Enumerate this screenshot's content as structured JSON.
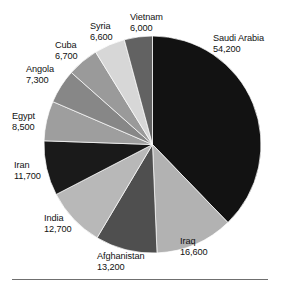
{
  "chart_data": {
    "type": "pie",
    "title": "",
    "subtitle": "",
    "xlabel": "",
    "ylabel": "",
    "legend_position": "labels-around-slices",
    "grid": false,
    "total": 147500,
    "categories": [
      "Saudi Arabia",
      "Iraq",
      "Afghanistan",
      "India",
      "Iran",
      "Egypt",
      "Angola",
      "Cuba",
      "Syria",
      "Vietnam"
    ],
    "values": [
      54200,
      16600,
      13200,
      12700,
      11700,
      8500,
      7300,
      6700,
      6600,
      6000
    ],
    "value_labels": [
      "54,200",
      "16,600",
      "13,200",
      "12,700",
      "11,700",
      "8,500",
      "7,300",
      "6,700",
      "6,600",
      "6,000"
    ],
    "start_angle_deg": 0,
    "direction": "clockwise",
    "slices": [
      {
        "name": "Saudi Arabia",
        "value": 54200,
        "value_label": "54,200",
        "color": "#121212",
        "start_deg": 0.0,
        "end_deg": 132.3
      },
      {
        "name": "Iraq",
        "value": 16600,
        "value_label": "16,600",
        "color": "#b2b2b2",
        "start_deg": 132.3,
        "end_deg": 172.8
      },
      {
        "name": "Afghanistan",
        "value": 13200,
        "value_label": "13,200",
        "color": "#4f4f4f",
        "start_deg": 172.8,
        "end_deg": 205.0
      },
      {
        "name": "India",
        "value": 12700,
        "value_label": "12,700",
        "color": "#b8b8b8",
        "start_deg": 205.0,
        "end_deg": 236.0
      },
      {
        "name": "Iran",
        "value": 11700,
        "value_label": "11,700",
        "color": "#1a1a1a",
        "start_deg": 236.0,
        "end_deg": 264.6
      },
      {
        "name": "Egypt",
        "value": 8500,
        "value_label": "8,500",
        "color": "#9e9e9e",
        "start_deg": 264.6,
        "end_deg": 285.3
      },
      {
        "name": "Angola",
        "value": 7300,
        "value_label": "7,300",
        "color": "#878787",
        "start_deg": 285.3,
        "end_deg": 303.1
      },
      {
        "name": "Cuba",
        "value": 6700,
        "value_label": "6,700",
        "color": "#9a9a9a",
        "start_deg": 303.1,
        "end_deg": 319.5
      },
      {
        "name": "Syria",
        "value": 6600,
        "value_label": "6,600",
        "color": "#d7d7d7",
        "start_deg": 319.5,
        "end_deg": 335.6
      },
      {
        "name": "Vietnam",
        "value": 6000,
        "value_label": "6,000",
        "color": "#626262",
        "start_deg": 335.6,
        "end_deg": 350.2
      }
    ]
  },
  "labels": {
    "saudi_arabia": {
      "name": "Saudi Arabia",
      "value": "54,200"
    },
    "iraq": {
      "name": "Iraq",
      "value": "16,600"
    },
    "afghanistan": {
      "name": "Afghanistan",
      "value": "13,200"
    },
    "india": {
      "name": "India",
      "value": "12,700"
    },
    "iran": {
      "name": "Iran",
      "value": "11,700"
    },
    "egypt": {
      "name": "Egypt",
      "value": "8,500"
    },
    "angola": {
      "name": "Angola",
      "value": "7,300"
    },
    "cuba": {
      "name": "Cuba",
      "value": "6,700"
    },
    "syria": {
      "name": "Syria",
      "value": "6,600"
    },
    "vietnam": {
      "name": "Vietnam",
      "value": "6,000"
    }
  }
}
